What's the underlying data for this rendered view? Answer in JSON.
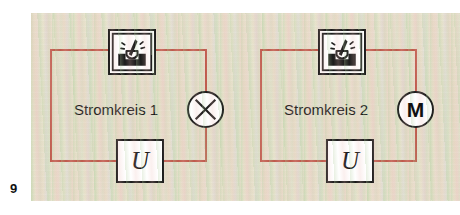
{
  "figure": {
    "number": "9",
    "caption_visible": false
  },
  "canvas": {
    "width": 460,
    "height": 215,
    "page_background": "#ffffff",
    "panel_background": "#e7e4cf",
    "panel_texture": "mottled green-pink vertical striping"
  },
  "colors": {
    "wire": "#bf5a4c",
    "ink": "#1b1b1b",
    "component_fill": "#ffffff",
    "text": "#1a1a1a"
  },
  "circuits": [
    {
      "id": "circuit-1",
      "label": "Stromkreis 1",
      "switch": {
        "icon": "rocker-switch-icon",
        "label": ""
      },
      "source": {
        "symbol": "U",
        "name": "voltage-source"
      },
      "load": {
        "symbol": "lamp-cross-circle",
        "name": "lamp",
        "letter": ""
      }
    },
    {
      "id": "circuit-2",
      "label": "Stromkreis 2",
      "switch": {
        "icon": "rocker-switch-icon",
        "label": ""
      },
      "source": {
        "symbol": "U",
        "name": "voltage-source"
      },
      "load": {
        "symbol": "motor-circle",
        "name": "motor",
        "letter": "M"
      }
    }
  ]
}
